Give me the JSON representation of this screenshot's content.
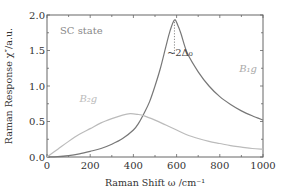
{
  "chart_data": {
    "type": "line",
    "title": "",
    "xlabel": "Raman Shift ω /cm⁻¹",
    "ylabel": "Raman Response χ″/a.u.",
    "xlim": [
      0,
      1000
    ],
    "ylim": [
      0,
      2.0
    ],
    "xticks": [
      0,
      200,
      400,
      600,
      800,
      1000
    ],
    "xtick_labels": [
      "0",
      "200",
      "400",
      "600",
      "800",
      "1000"
    ],
    "yticks": [
      0.0,
      0.5,
      1.0,
      1.5,
      2.0
    ],
    "ytick_labels": [
      "0.0",
      "0.5",
      "1.0",
      "1.5",
      "2.0"
    ],
    "grid": false,
    "legend": "none",
    "series": [
      {
        "name": "B1g",
        "color": "#777777",
        "x": [
          0,
          50,
          100,
          150,
          200,
          250,
          300,
          350,
          400,
          425,
          450,
          475,
          500,
          525,
          550,
          570,
          590,
          605,
          620,
          650,
          700,
          750,
          800,
          850,
          900,
          950,
          1000
        ],
        "y": [
          0.0,
          0.005,
          0.02,
          0.045,
          0.08,
          0.12,
          0.18,
          0.26,
          0.38,
          0.48,
          0.62,
          0.78,
          1.0,
          1.25,
          1.55,
          1.78,
          1.93,
          1.86,
          1.74,
          1.46,
          1.2,
          1.0,
          0.85,
          0.74,
          0.65,
          0.58,
          0.52
        ]
      },
      {
        "name": "B2g",
        "color": "#bbbbbb",
        "x": [
          0,
          50,
          100,
          150,
          200,
          250,
          300,
          350,
          385,
          420,
          450,
          500,
          550,
          600,
          650,
          700,
          750,
          800,
          850,
          900,
          950,
          1000
        ],
        "y": [
          0.0,
          0.11,
          0.22,
          0.32,
          0.4,
          0.48,
          0.54,
          0.59,
          0.61,
          0.6,
          0.58,
          0.52,
          0.45,
          0.38,
          0.31,
          0.26,
          0.22,
          0.19,
          0.16,
          0.14,
          0.12,
          0.11
        ]
      }
    ],
    "annotations": [
      {
        "text": "SC state",
        "x": 60,
        "y": 1.73,
        "color": "#888888"
      },
      {
        "text": "~2Δ₀",
        "x": 555,
        "y": 1.42,
        "color": "#444444"
      },
      {
        "text": "B₁g",
        "x": 890,
        "y": 1.2,
        "color": "#aaaaaa"
      },
      {
        "text": "B₂g",
        "x": 150,
        "y": 0.77,
        "color": "#bbbbbb"
      }
    ],
    "gap_marker": {
      "x": 590,
      "y_from": 1.93,
      "y_to": 1.45,
      "style": "dotted"
    }
  }
}
